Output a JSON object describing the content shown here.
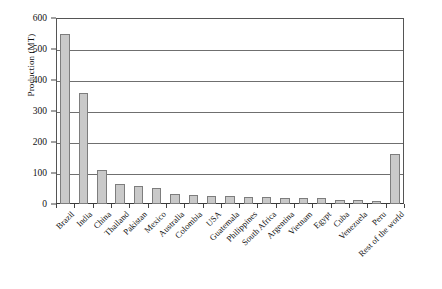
{
  "chart_data": {
    "type": "bar",
    "title": "",
    "xlabel": "",
    "ylabel": "Production (MT)",
    "ylim": [
      0,
      600
    ],
    "ytick_step": 100,
    "yticks": [
      0,
      100,
      200,
      300,
      400,
      500,
      600
    ],
    "ytick_labels": [
      "0",
      "100",
      "200",
      "300",
      "400",
      "500",
      "600"
    ],
    "grid": "horizontal",
    "legend": "none",
    "bar_fill_color": "#c9c9c9",
    "bar_border_color": "#7d7d7d",
    "categories": [
      "Brazil",
      "India",
      "China",
      "Thailand",
      "Pakistan",
      "Mexico",
      "Australia",
      "Colombia",
      "USA",
      "Guatemala",
      "Philippines",
      "South Africa",
      "Argentina",
      "Vietnam",
      "Egypt",
      "Cuba",
      "Venezuela",
      "Peru",
      "Rest of the world"
    ],
    "values": [
      550,
      358,
      110,
      65,
      58,
      52,
      32,
      28,
      26,
      25,
      24,
      22,
      21,
      20,
      18,
      14,
      12,
      10,
      162
    ]
  }
}
